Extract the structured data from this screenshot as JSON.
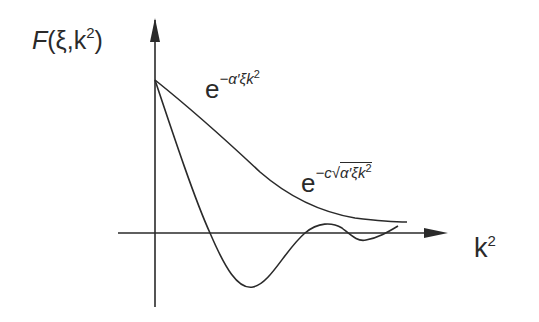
{
  "diagram": {
    "y_axis_label": {
      "prefix": "F",
      "args": "(ξ,k",
      "sup": "2",
      "close": ")"
    },
    "x_axis_label": {
      "base": "k",
      "sup": "2"
    },
    "curves": [
      {
        "name": "gaussian-decay",
        "label_base": "e",
        "label_exponent": "−α′ξk²",
        "label_exponent_parts": {
          "sign": "−",
          "body": "α′ξk",
          "sup": "2"
        },
        "description": "monotonic exponential falloff approaching zero"
      },
      {
        "name": "sqrt-exponential-decay",
        "label_base": "e",
        "label_exponent": "−c√(α′ξk²)",
        "label_exponent_parts": {
          "sign": "−c",
          "radicand": "α′ξk",
          "sup": "2"
        },
        "description": "steeper falloff that crosses zero and oscillates"
      }
    ],
    "colors": {
      "ink": "#2a2a2a",
      "background": "#ffffff"
    }
  }
}
